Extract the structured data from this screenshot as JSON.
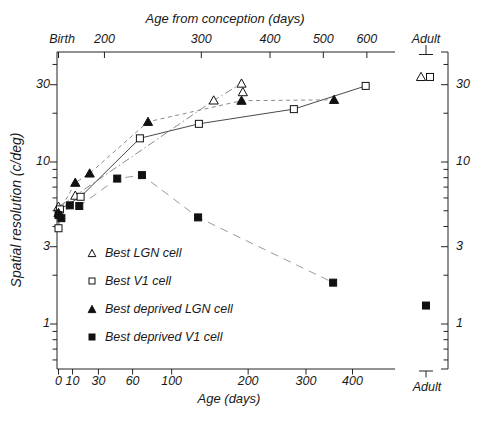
{
  "figure": {
    "background": "#ffffff",
    "ink": "#1a1a1a",
    "solid_line_color": "#4a4a4a",
    "dashed_line_color": "#8a8a8a"
  },
  "chart_data": {
    "type": "scatter",
    "x_axis": {
      "bottom_label": "Age (days)",
      "bottom_ticks": [
        0,
        10,
        30,
        60,
        100,
        200,
        300,
        400
      ],
      "top_label": "Age from conception (days)",
      "top_ticks": [
        200,
        300,
        400,
        500,
        600
      ],
      "birth_label": "Birth",
      "adult_label": "Adult",
      "scale": "log-age-from-conception",
      "gestation_days": 165
    },
    "y_axis": {
      "label": "Spatial resolution (c/deg)",
      "scale": "log",
      "major_ticks": [
        1,
        3,
        10,
        30
      ],
      "minor_ticks": [
        0.6,
        0.7,
        0.8,
        0.9,
        2,
        4,
        5,
        6,
        7,
        8,
        9,
        20,
        40
      ],
      "range": [
        0.55,
        47
      ]
    },
    "series": [
      {
        "name": "Best LGN cell",
        "marker": "open-triangle",
        "line_style": "dashdot",
        "points": [
          {
            "age": 0,
            "res": 5.3
          },
          {
            "age": 12,
            "res": 6.2
          },
          {
            "age": 151,
            "res": 24
          },
          {
            "age": 192,
            "res": 27
          },
          {
            "age": 190,
            "res": 30.5
          }
        ],
        "line_point_indices": [
          0,
          1,
          2,
          4
        ],
        "adult_res": 33.5
      },
      {
        "name": "Best V1 cell",
        "marker": "open-square",
        "line_style": "solid",
        "points": [
          {
            "age": 0,
            "res": 3.9
          },
          {
            "age": 1,
            "res": 5.1
          },
          {
            "age": 16,
            "res": 6.1
          },
          {
            "age": 67,
            "res": 14
          },
          {
            "age": 132,
            "res": 17.2
          },
          {
            "age": 277,
            "res": 21.2
          },
          {
            "age": 432,
            "res": 29.5
          }
        ],
        "adult_res": 33.5
      },
      {
        "name": "Best deprived LGN cell",
        "marker": "filled-triangle",
        "line_style": "dash",
        "points": [
          {
            "age": 0,
            "res": 4.85
          },
          {
            "age": 12,
            "res": 7.45
          },
          {
            "age": 23,
            "res": 8.5
          },
          {
            "age": 75,
            "res": 17.7
          },
          {
            "age": 190,
            "res": 23.9
          },
          {
            "age": 358,
            "res": 24.2
          }
        ]
      },
      {
        "name": "Best deprived V1 cell",
        "marker": "filled-square",
        "line_style": "longdash",
        "points": [
          {
            "age": 0,
            "res": 4.7
          },
          {
            "age": 2,
            "res": 4.5
          },
          {
            "age": 8,
            "res": 5.4
          },
          {
            "age": 15,
            "res": 5.35
          },
          {
            "age": 46,
            "res": 7.9
          },
          {
            "age": 69,
            "res": 8.3
          },
          {
            "age": 131,
            "res": 4.55
          },
          {
            "age": 356,
            "res": 1.8
          }
        ],
        "adult_res": 1.3
      }
    ]
  }
}
